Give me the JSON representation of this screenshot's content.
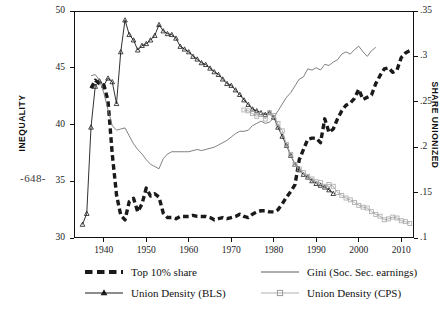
{
  "page": {
    "number": "-648-"
  },
  "figure": {
    "axis_left_title": "INEQUALITY",
    "axis_right_title": "SHARE UNIONIZED"
  },
  "legend": {
    "entries": [
      {
        "key": "top10",
        "label": "Top 10% share",
        "style": "thick-dashed",
        "color": "#1a1a1a"
      },
      {
        "key": "bls",
        "label": "Union Density (BLS)",
        "style": "line-triangle",
        "color": "#1a1a1a"
      },
      {
        "key": "gini",
        "label": "Gini (Soc. Sec. earnings)",
        "style": "thin-line",
        "color": "#555555"
      },
      {
        "key": "cps",
        "label": "Union Density (CPS)",
        "style": "line-square",
        "color": "#9a9a9a"
      }
    ]
  },
  "chart_data": {
    "type": "line",
    "title": "",
    "xlabel": "",
    "ylabel": "INEQUALITY",
    "ylabel_right": "SHARE UNIONIZED",
    "xlim": [
      1933,
      2013
    ],
    "ylim": [
      30,
      50
    ],
    "ylim_right": [
      0.1,
      0.35
    ],
    "xticks": [
      1940,
      1950,
      1960,
      1970,
      1980,
      1990,
      2000,
      2010
    ],
    "yticks_left": [
      30,
      35,
      40,
      45,
      50
    ],
    "yticks_right": [
      0.1,
      0.15,
      0.2,
      0.25,
      0.3,
      0.35
    ],
    "grid": false,
    "legend_position": "below",
    "series": [
      {
        "name": "Top 10% share",
        "axis": "left",
        "color": "#1a1a1a",
        "style": "thick-dashed",
        "x": [
          1937,
          1938,
          1939,
          1940,
          1941,
          1942,
          1943,
          1944,
          1945,
          1946,
          1947,
          1948,
          1949,
          1950,
          1951,
          1952,
          1953,
          1954,
          1955,
          1956,
          1957,
          1958,
          1959,
          1960,
          1961,
          1962,
          1963,
          1964,
          1965,
          1966,
          1967,
          1968,
          1969,
          1970,
          1971,
          1972,
          1973,
          1974,
          1975,
          1976,
          1977,
          1978,
          1979,
          1980,
          1981,
          1982,
          1983,
          1984,
          1985,
          1986,
          1987,
          1988,
          1989,
          1990,
          1991,
          1992,
          1993,
          1994,
          1995,
          1996,
          1997,
          1998,
          1999,
          2000,
          2001,
          2002,
          2003,
          2004,
          2005,
          2006,
          2007,
          2008,
          2009,
          2010,
          2011,
          2012
        ],
        "y": [
          43.2,
          43.9,
          43.6,
          43.5,
          42.1,
          37.4,
          33.8,
          32.0,
          31.6,
          33.2,
          33.5,
          32.3,
          33.0,
          34.4,
          33.7,
          33.9,
          33.6,
          32.2,
          31.8,
          31.8,
          31.7,
          31.9,
          31.9,
          31.9,
          32.0,
          31.9,
          31.9,
          31.9,
          31.8,
          31.6,
          31.7,
          31.8,
          31.7,
          31.8,
          31.9,
          32.1,
          31.9,
          31.8,
          32.1,
          32.3,
          32.4,
          32.4,
          32.3,
          32.3,
          32.5,
          33.0,
          33.6,
          34.1,
          34.7,
          36.9,
          37.8,
          38.7,
          38.8,
          38.8,
          38.4,
          40.5,
          39.3,
          39.6,
          40.5,
          41.2,
          41.7,
          41.9,
          42.3,
          43.1,
          42.2,
          42.4,
          42.6,
          43.6,
          44.3,
          44.9,
          45.0,
          44.6,
          44.8,
          45.9,
          46.3,
          46.5
        ]
      },
      {
        "name": "Union Density (BLS)",
        "axis": "right",
        "color": "#1a1a1a",
        "style": "line-triangle",
        "x": [
          1935,
          1936,
          1937,
          1938,
          1939,
          1940,
          1941,
          1942,
          1943,
          1944,
          1945,
          1946,
          1947,
          1948,
          1949,
          1950,
          1951,
          1952,
          1953,
          1954,
          1955,
          1956,
          1957,
          1958,
          1959,
          1960,
          1961,
          1962,
          1963,
          1964,
          1965,
          1966,
          1967,
          1968,
          1969,
          1970,
          1971,
          1972,
          1973,
          1974,
          1975,
          1976,
          1977,
          1978,
          1979,
          1980,
          1981,
          1982,
          1983,
          1984,
          1985,
          1986,
          1987,
          1988,
          1989,
          1990,
          1991,
          1992,
          1993,
          1994
        ],
        "y": [
          0.115,
          0.127,
          0.222,
          0.267,
          0.273,
          0.268,
          0.276,
          0.272,
          0.248,
          0.305,
          0.34,
          0.324,
          0.318,
          0.307,
          0.312,
          0.314,
          0.318,
          0.323,
          0.335,
          0.328,
          0.325,
          0.324,
          0.32,
          0.311,
          0.308,
          0.305,
          0.3,
          0.297,
          0.293,
          0.291,
          0.287,
          0.283,
          0.28,
          0.275,
          0.27,
          0.268,
          0.263,
          0.258,
          0.252,
          0.247,
          0.242,
          0.24,
          0.238,
          0.236,
          0.238,
          0.233,
          0.222,
          0.212,
          0.202,
          0.191,
          0.181,
          0.175,
          0.17,
          0.167,
          0.163,
          0.16,
          0.158,
          0.156,
          0.153,
          0.149
        ]
      },
      {
        "name": "Gini (Soc. Sec. earnings)",
        "axis": "left",
        "color": "#6a6a6a",
        "style": "thin-line",
        "x": [
          1937,
          1938,
          1939,
          1940,
          1941,
          1942,
          1943,
          1944,
          1945,
          1946,
          1947,
          1948,
          1949,
          1950,
          1951,
          1952,
          1953,
          1954,
          1955,
          1956,
          1957,
          1958,
          1959,
          1960,
          1961,
          1962,
          1963,
          1964,
          1965,
          1966,
          1967,
          1968,
          1969,
          1970,
          1971,
          1972,
          1973,
          1974,
          1975,
          1976,
          1977,
          1978,
          1979,
          1980,
          1981,
          1982,
          1983,
          1984,
          1985,
          1986,
          1987,
          1988,
          1989,
          1990,
          1991,
          1992,
          1993,
          1994,
          1995,
          1996,
          1997,
          1998,
          1999,
          2000,
          2001,
          2002,
          2003,
          2004
        ],
        "y": [
          44.3,
          44.4,
          43.9,
          42.8,
          41.3,
          39.9,
          39.5,
          39.6,
          39.7,
          39.0,
          38.3,
          37.8,
          37.4,
          36.9,
          36.5,
          36.3,
          36.1,
          37.0,
          37.4,
          37.6,
          37.6,
          37.6,
          37.6,
          37.6,
          37.7,
          37.8,
          37.7,
          37.8,
          37.9,
          38.0,
          38.2,
          38.4,
          38.6,
          38.9,
          39.2,
          39.4,
          39.4,
          39.5,
          39.9,
          40.1,
          40.3,
          40.1,
          40.2,
          40.6,
          41.2,
          41.8,
          42.4,
          42.8,
          43.4,
          44.0,
          44.2,
          44.9,
          44.8,
          45.0,
          44.8,
          45.3,
          45.2,
          45.5,
          45.7,
          46.2,
          46.4,
          46.2,
          46.6,
          46.9,
          46.4,
          46.0,
          46.5,
          46.8
        ]
      },
      {
        "name": "Union Density (CPS)",
        "axis": "right",
        "color": "#a8a8a8",
        "style": "line-square",
        "x": [
          1973,
          1974,
          1975,
          1976,
          1977,
          1978,
          1979,
          1980,
          1981,
          1982,
          1983,
          1984,
          1985,
          1986,
          1987,
          1988,
          1989,
          1990,
          1991,
          1992,
          1993,
          1994,
          1995,
          1996,
          1997,
          1998,
          1999,
          2000,
          2001,
          2002,
          2003,
          2004,
          2005,
          2006,
          2007,
          2008,
          2009,
          2010,
          2011,
          2012
        ],
        "y": [
          0.241,
          0.24,
          0.237,
          0.234,
          0.236,
          0.231,
          0.238,
          0.235,
          0.226,
          0.218,
          0.203,
          0.192,
          0.181,
          0.176,
          0.172,
          0.168,
          0.165,
          0.162,
          0.161,
          0.157,
          0.159,
          0.157,
          0.15,
          0.147,
          0.144,
          0.142,
          0.139,
          0.136,
          0.134,
          0.133,
          0.129,
          0.126,
          0.124,
          0.12,
          0.121,
          0.123,
          0.122,
          0.119,
          0.118,
          0.116
        ]
      }
    ]
  }
}
